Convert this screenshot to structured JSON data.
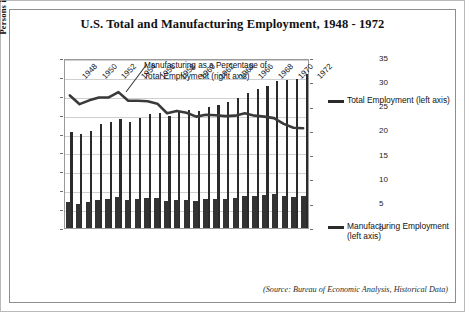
{
  "title": "U.S. Total and Manufacturing Employment, 1948 - 1972",
  "y_axis_title": "Persons in Thousands",
  "annotation": "Manufacturing as a Percentage of Total Employment (right axis)",
  "legend": {
    "total": "Total Employment (left axis)",
    "manufacturing": "Manufacturing Employment (left axis)"
  },
  "source": "(Source: Bureau of Economic Analysis, Historical Data)",
  "colors": {
    "bar": "#2b2b2b",
    "line": "#3a3a3a",
    "grid": "#cfcfcf",
    "frame": "#8e8e8e"
  },
  "chart_data": {
    "type": "bar",
    "title": "U.S. Total and Manufacturing Employment, 1948 - 1972",
    "xlabel": "",
    "ylabel": "Persons in Thousands",
    "y2label": "",
    "ylim": [
      0,
      90000
    ],
    "y2lim": [
      0,
      35
    ],
    "yticks": [
      0,
      10000,
      20000,
      30000,
      40000,
      50000,
      60000,
      70000,
      80000,
      90000
    ],
    "y2ticks": [
      0,
      5,
      10,
      15,
      20,
      25,
      30,
      35
    ],
    "grid": true,
    "legend_position": "right",
    "x": [
      1948,
      1949,
      1950,
      1951,
      1952,
      1953,
      1954,
      1955,
      1956,
      1957,
      1958,
      1959,
      1960,
      1961,
      1962,
      1963,
      1964,
      1965,
      1966,
      1967,
      1968,
      1969,
      1970,
      1971,
      1972
    ],
    "xtick_labels": [
      "1948",
      "1950",
      "1952",
      "1954",
      "1956",
      "1958",
      "1960",
      "1962",
      "1964",
      "1966",
      "1968",
      "1970",
      "1972"
    ],
    "series": [
      {
        "name": "Total Employment (left axis)",
        "axis": "left",
        "type": "bar",
        "values": [
          50800,
          49600,
          51400,
          55100,
          56200,
          57600,
          56300,
          58500,
          60300,
          60900,
          59100,
          61400,
          62400,
          62200,
          63900,
          65000,
          66600,
          68800,
          71700,
          73400,
          75400,
          77900,
          78300,
          79100,
          81700
        ]
      },
      {
        "name": "Manufacturing Employment (left axis)",
        "axis": "left",
        "type": "bar",
        "values": [
          14000,
          12800,
          13700,
          15000,
          15300,
          16300,
          14900,
          15500,
          15900,
          15800,
          14100,
          15000,
          15000,
          14400,
          15100,
          15300,
          15500,
          16100,
          17100,
          17200,
          17500,
          17800,
          17000,
          16500,
          17000
        ]
      },
      {
        "name": "Manufacturing as a Percentage of Total Employment (right axis)",
        "axis": "right",
        "type": "line",
        "values": [
          27.6,
          25.8,
          26.6,
          27.2,
          27.2,
          28.3,
          26.5,
          26.5,
          26.4,
          25.9,
          23.9,
          24.4,
          24.0,
          23.2,
          23.6,
          23.5,
          23.3,
          23.4,
          23.9,
          23.4,
          23.2,
          22.9,
          21.7,
          20.9,
          20.8
        ]
      }
    ]
  }
}
